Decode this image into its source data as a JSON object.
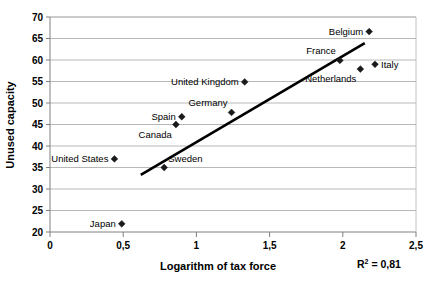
{
  "chart_data": {
    "type": "scatter",
    "title": "",
    "xlabel": "Logarithm of tax force",
    "ylabel": "Unused capacity",
    "xlim": [
      0,
      2.5
    ],
    "ylim": [
      20,
      70
    ],
    "xticks": [
      "0",
      "0,5",
      "1",
      "1,5",
      "2",
      "2,5"
    ],
    "xtick_values": [
      0,
      0.5,
      1,
      1.5,
      2,
      2.5
    ],
    "yticks": [
      "20",
      "25",
      "30",
      "35",
      "40",
      "45",
      "50",
      "55",
      "60",
      "65",
      "70"
    ],
    "ytick_values": [
      20,
      25,
      30,
      35,
      40,
      45,
      50,
      55,
      60,
      65,
      70
    ],
    "grid": "horizontal",
    "legend": "none",
    "annotation": "R2 = 0,81",
    "annotation_parts": {
      "r": "R",
      "sup": "2",
      "rest": " = 0,81"
    },
    "points": [
      {
        "label": "United States",
        "x": 0.44,
        "y": 37.0,
        "label_pos": "left"
      },
      {
        "label": "Japan",
        "x": 0.49,
        "y": 21.9,
        "label_pos": "left"
      },
      {
        "label": "Sweden",
        "x": 0.78,
        "y": 35.0,
        "label_pos": "above-right"
      },
      {
        "label": "Canada",
        "x": 0.86,
        "y": 45.0,
        "label_pos": "below-left"
      },
      {
        "label": "Spain",
        "x": 0.9,
        "y": 46.8,
        "label_pos": "left"
      },
      {
        "label": "Germany",
        "x": 1.24,
        "y": 47.8,
        "label_pos": "above-left"
      },
      {
        "label": "United Kingdom",
        "x": 1.33,
        "y": 54.9,
        "label_pos": "left"
      },
      {
        "label": "France",
        "x": 1.98,
        "y": 59.9,
        "label_pos": "above-left"
      },
      {
        "label": "Netherlands",
        "x": 2.12,
        "y": 57.9,
        "label_pos": "below-left"
      },
      {
        "label": "Italy",
        "x": 2.22,
        "y": 59.0,
        "label_pos": "right"
      },
      {
        "label": "Belgium",
        "x": 2.18,
        "y": 66.6,
        "label_pos": "left"
      }
    ],
    "trendline": {
      "x_start": 0.62,
      "y_start": 33.3,
      "x_end": 2.15,
      "y_end": 63.9
    }
  }
}
